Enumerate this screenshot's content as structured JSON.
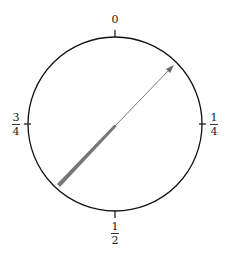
{
  "diagram": {
    "type": "phase-circle",
    "labels": {
      "top": "0",
      "right": {
        "num": "1",
        "den": "4"
      },
      "bottom": {
        "num": "1",
        "den": "2"
      },
      "left": {
        "num": "3",
        "den": "4"
      }
    },
    "arrow": {
      "description": "arrow from lower-left (thick) through center to upper-right (thin, arrowhead)",
      "color": "#666666"
    },
    "colors": {
      "circle": "#111111",
      "arrow": "#666666"
    }
  }
}
